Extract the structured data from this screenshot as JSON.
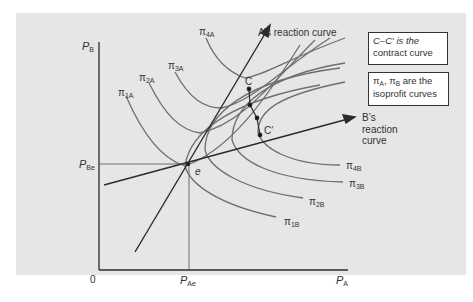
{
  "figure": {
    "background": "#e6e6e6",
    "curve_color": "#6e6e6e",
    "line_color": "#2b2b2b",
    "axes": {
      "x_label": "P",
      "x_label_sub": "A",
      "y_label": "P",
      "y_label_sub": "B",
      "origin_label": "0",
      "x_eq_label": "P",
      "x_eq_label_sub": "Ae",
      "y_eq_label": "P",
      "y_eq_label_sub": "Be"
    },
    "points": {
      "equilibrium": "e",
      "contract_start": "C",
      "contract_end": "C′"
    },
    "reaction_curves": {
      "a_label": "A’s reaction curve",
      "b_label_line1": "B’s",
      "b_label_line2": "reaction",
      "b_label_line3": "curve"
    },
    "isoprofit_a": [
      {
        "sym": "π",
        "sub": "1A"
      },
      {
        "sym": "π",
        "sub": "2A"
      },
      {
        "sym": "π",
        "sub": "3A"
      },
      {
        "sym": "π",
        "sub": "4A"
      }
    ],
    "isoprofit_b": [
      {
        "sym": "π",
        "sub": "1B"
      },
      {
        "sym": "π",
        "sub": "2B"
      },
      {
        "sym": "π",
        "sub": "3B"
      },
      {
        "sym": "π",
        "sub": "4B"
      }
    ],
    "notes": {
      "contract_line1": "C–C′ is the",
      "contract_line2": "contract curve",
      "iso_pi_a": "π",
      "iso_pi_a_sub": "A",
      "iso_sep": ", ",
      "iso_pi_b": "π",
      "iso_pi_b_sub": "B",
      "iso_line1_rest": " are the",
      "iso_line2": "isoprofit curves"
    }
  }
}
